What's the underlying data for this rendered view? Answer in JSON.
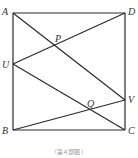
{
  "diagram": {
    "type": "geometry",
    "points": {
      "A": {
        "label": "A",
        "x": 13,
        "y": 13
      },
      "D": {
        "label": "D",
        "x": 125,
        "y": 13
      },
      "B": {
        "label": "B",
        "x": 13,
        "y": 130
      },
      "C": {
        "label": "C",
        "x": 125,
        "y": 130
      },
      "U": {
        "label": "U",
        "x": 13,
        "y": 64
      },
      "V": {
        "label": "V",
        "x": 125,
        "y": 100
      },
      "P": {
        "label": "P",
        "x": 54,
        "y": 45
      },
      "Q": {
        "label": "Q",
        "x": 89,
        "y": 110
      }
    },
    "segments": [
      [
        "A",
        "D"
      ],
      [
        "D",
        "C"
      ],
      [
        "C",
        "B"
      ],
      [
        "B",
        "A"
      ],
      [
        "A",
        "V"
      ],
      [
        "D",
        "U"
      ],
      [
        "U",
        "C"
      ],
      [
        "B",
        "V"
      ]
    ],
    "caption": "（第4题图）"
  }
}
